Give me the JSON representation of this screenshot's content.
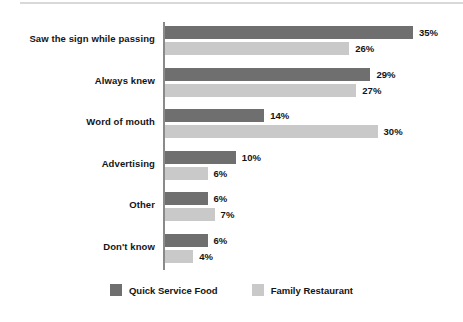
{
  "chart_data": {
    "type": "bar",
    "orientation": "horizontal",
    "title": "",
    "subtitle": "",
    "xlabel": "",
    "ylabel": "",
    "xlim": [
      0,
      35
    ],
    "grid": false,
    "legend_position": "bottom-center",
    "value_suffix": "%",
    "categories": [
      "Saw the sign while passing",
      "Always knew",
      "Word of mouth",
      "Advertising",
      "Other",
      "Don't know"
    ],
    "series": [
      {
        "name": "Quick Service Food",
        "color": "#6f6f6f",
        "values": [
          35,
          29,
          14,
          10,
          6,
          6
        ],
        "labels": [
          "35%",
          "29%",
          "14%",
          "10%",
          "6%",
          "6%"
        ]
      },
      {
        "name": "Family Restaurant",
        "color": "#c9c9c9",
        "values": [
          26,
          27,
          30,
          6,
          7,
          4
        ],
        "labels": [
          "26%",
          "27%",
          "30%",
          "6%",
          "7%",
          "4%"
        ]
      }
    ]
  },
  "legend": {
    "items": [
      {
        "label": "Quick Service Food",
        "color": "#6f6f6f"
      },
      {
        "label": "Family Restaurant",
        "color": "#c9c9c9"
      }
    ]
  }
}
